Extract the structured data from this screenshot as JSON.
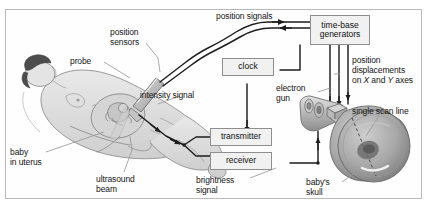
{
  "caption_cut": "the screen to show a map of the part of the body",
  "figure": {
    "units": [
      {
        "id": "time-base-generators",
        "label": "time-base\ngenerators",
        "line1": "time-base",
        "line2": "generators"
      },
      {
        "id": "clock",
        "label": "clock",
        "line1": "clock",
        "line2": ""
      },
      {
        "id": "transmitter",
        "label": "transmitter",
        "line1": "transmitter",
        "line2": ""
      },
      {
        "id": "receiver",
        "label": "receiver",
        "line1": "receiver",
        "line2": ""
      }
    ],
    "labels": [
      {
        "id": "position-signals",
        "text": "position signals"
      },
      {
        "id": "position-sensors-1",
        "text": "position"
      },
      {
        "id": "position-sensors-2",
        "text": "sensors"
      },
      {
        "id": "probe",
        "text": "probe"
      },
      {
        "id": "intensity-signal",
        "text": "intensity signal"
      },
      {
        "id": "electron-gun-1",
        "text": "electron"
      },
      {
        "id": "electron-gun-2",
        "text": "gun"
      },
      {
        "id": "position-displacements-1",
        "text": "position"
      },
      {
        "id": "position-displacements-2",
        "text": "displacements"
      },
      {
        "id": "single-scan-line",
        "text": "single scan line"
      },
      {
        "id": "baby-in-uterus-1",
        "text": "baby"
      },
      {
        "id": "baby-in-uterus-2",
        "text": "in uterus"
      },
      {
        "id": "ultrasound-beam-1",
        "text": "ultrasound"
      },
      {
        "id": "ultrasound-beam-2",
        "text": "beam"
      },
      {
        "id": "brightness-signal-1",
        "text": "brightness"
      },
      {
        "id": "brightness-signal-2",
        "text": "signal"
      },
      {
        "id": "babys-skull-1",
        "text": "baby's"
      },
      {
        "id": "babys-skull-2",
        "text": "skull"
      }
    ],
    "axes_label": {
      "prefix": "on ",
      "x": "X",
      "mid": " and ",
      "y": "Y",
      "suffix": " axes"
    },
    "colors": {
      "frame_border": "#b9b9b9",
      "box_fill": "#f1f1f1",
      "box_border": "#8e8e8e",
      "wire": "#1d1d1d",
      "leader": "#9a9a9a",
      "body_fill": "#dcdcdc",
      "body_stroke": "#8a8a8a",
      "hair": "#4a4a4a",
      "crt_fill": "#b4b4b4",
      "crt_stroke": "#6e6e6e",
      "text": "#141414"
    }
  }
}
